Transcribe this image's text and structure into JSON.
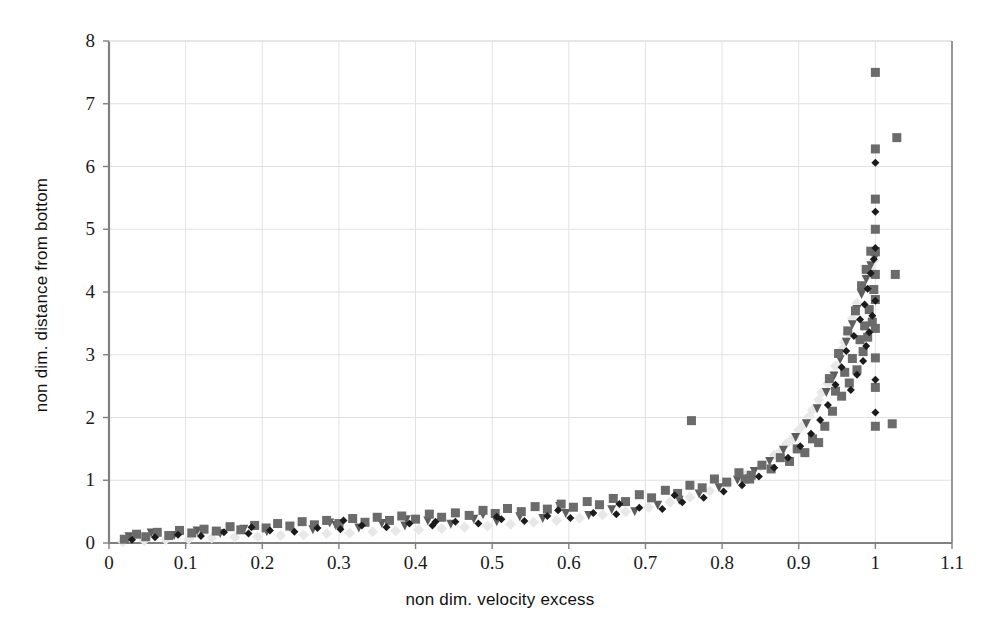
{
  "chart_data": {
    "type": "scatter",
    "title": "",
    "xlabel": "non dim. velocity excess",
    "ylabel": "non dim. distance from bottom",
    "xlim": [
      0,
      1.1
    ],
    "ylim": [
      0,
      8
    ],
    "xticks": [
      0,
      0.1,
      0.2,
      0.3,
      0.4,
      0.5,
      0.6,
      0.7,
      0.8,
      0.9,
      1,
      1.1
    ],
    "xtick_labels": [
      "0",
      "0.1",
      "0.2",
      "0.3",
      "0.4",
      "0.5",
      "0.6",
      "0.7",
      "0.8",
      "0.9",
      "1",
      "1.1"
    ],
    "yticks": [
      0,
      1,
      2,
      3,
      4,
      5,
      6,
      7,
      8
    ],
    "ytick_labels": [
      "0",
      "1",
      "2",
      "3",
      "4",
      "5",
      "6",
      "7",
      "8"
    ],
    "grid": true,
    "legend": "none",
    "background": "#ffffff",
    "gridline_color": "#e2e2e2",
    "axis_color": "#808080",
    "series": [
      {
        "name": "series-1-dark-square",
        "marker": "square",
        "color": "#6b6b6b",
        "size": 9,
        "points": [
          [
            0.02,
            0.06
          ],
          [
            0.036,
            0.14
          ],
          [
            0.048,
            0.1
          ],
          [
            0.063,
            0.17
          ],
          [
            0.078,
            0.12
          ],
          [
            0.092,
            0.2
          ],
          [
            0.108,
            0.16
          ],
          [
            0.124,
            0.22
          ],
          [
            0.14,
            0.19
          ],
          [
            0.158,
            0.26
          ],
          [
            0.172,
            0.21
          ],
          [
            0.19,
            0.28
          ],
          [
            0.205,
            0.24
          ],
          [
            0.22,
            0.31
          ],
          [
            0.236,
            0.27
          ],
          [
            0.252,
            0.34
          ],
          [
            0.268,
            0.29
          ],
          [
            0.284,
            0.36
          ],
          [
            0.3,
            0.31
          ],
          [
            0.318,
            0.39
          ],
          [
            0.334,
            0.33
          ],
          [
            0.35,
            0.41
          ],
          [
            0.366,
            0.36
          ],
          [
            0.382,
            0.43
          ],
          [
            0.4,
            0.38
          ],
          [
            0.418,
            0.46
          ],
          [
            0.434,
            0.41
          ],
          [
            0.452,
            0.48
          ],
          [
            0.47,
            0.44
          ],
          [
            0.488,
            0.52
          ],
          [
            0.504,
            0.47
          ],
          [
            0.52,
            0.55
          ],
          [
            0.538,
            0.5
          ],
          [
            0.556,
            0.58
          ],
          [
            0.572,
            0.54
          ],
          [
            0.59,
            0.62
          ],
          [
            0.606,
            0.57
          ],
          [
            0.624,
            0.66
          ],
          [
            0.64,
            0.61
          ],
          [
            0.658,
            0.71
          ],
          [
            0.674,
            0.66
          ],
          [
            0.692,
            0.77
          ],
          [
            0.708,
            0.72
          ],
          [
            0.726,
            0.84
          ],
          [
            0.742,
            0.79
          ],
          [
            0.758,
            0.92
          ],
          [
            0.76,
            1.95
          ],
          [
            0.774,
            0.88
          ],
          [
            0.79,
            1.02
          ],
          [
            0.806,
            0.97
          ],
          [
            0.822,
            1.12
          ],
          [
            0.83,
            1.02
          ],
          [
            0.838,
            1.08
          ],
          [
            0.852,
            1.24
          ],
          [
            0.864,
            1.18
          ],
          [
            0.876,
            1.36
          ],
          [
            0.888,
            1.3
          ],
          [
            0.898,
            1.5
          ],
          [
            0.908,
            1.44
          ],
          [
            0.918,
            1.66
          ],
          [
            0.926,
            1.6
          ],
          [
            0.934,
            1.86
          ],
          [
            0.94,
            2.62
          ],
          [
            0.944,
            2.1
          ],
          [
            0.948,
            2.42
          ],
          [
            0.952,
            3.02
          ],
          [
            0.956,
            2.34
          ],
          [
            0.96,
            2.72
          ],
          [
            0.964,
            3.38
          ],
          [
            0.966,
            2.55
          ],
          [
            0.97,
            2.94
          ],
          [
            0.974,
            3.7
          ],
          [
            0.976,
            2.76
          ],
          [
            0.98,
            3.24
          ],
          [
            0.982,
            4.1
          ],
          [
            0.984,
            3.05
          ],
          [
            0.986,
            3.46
          ],
          [
            0.988,
            4.36
          ],
          [
            0.99,
            3.28
          ],
          [
            0.992,
            3.72
          ],
          [
            0.994,
            4.65
          ],
          [
            0.996,
            3.52
          ],
          [
            0.998,
            4.04
          ],
          [
            1.0,
            5.0
          ],
          [
            1.0,
            5.48
          ],
          [
            1.0,
            6.28
          ],
          [
            1.0,
            7.5
          ],
          [
            1.0,
            4.28
          ],
          [
            1.0,
            4.64
          ],
          [
            1.0,
            3.88
          ],
          [
            1.0,
            3.42
          ],
          [
            1.0,
            2.95
          ],
          [
            1.0,
            2.48
          ],
          [
            1.0,
            1.86
          ],
          [
            1.028,
            6.46
          ],
          [
            1.026,
            4.28
          ],
          [
            1.022,
            1.9
          ],
          [
            0.836,
            1.02
          ]
        ]
      },
      {
        "name": "series-2-black-diamond",
        "marker": "diamond",
        "color": "#1b1b1b",
        "size": 8,
        "points": [
          [
            0.03,
            0.05
          ],
          [
            0.06,
            0.09
          ],
          [
            0.09,
            0.13
          ],
          [
            0.12,
            0.11
          ],
          [
            0.15,
            0.17
          ],
          [
            0.182,
            0.15
          ],
          [
            0.21,
            0.2
          ],
          [
            0.242,
            0.18
          ],
          [
            0.272,
            0.24
          ],
          [
            0.302,
            0.22
          ],
          [
            0.33,
            0.28
          ],
          [
            0.362,
            0.25
          ],
          [
            0.392,
            0.31
          ],
          [
            0.422,
            0.28
          ],
          [
            0.452,
            0.34
          ],
          [
            0.482,
            0.31
          ],
          [
            0.512,
            0.38
          ],
          [
            0.542,
            0.35
          ],
          [
            0.572,
            0.43
          ],
          [
            0.602,
            0.4
          ],
          [
            0.632,
            0.48
          ],
          [
            0.662,
            0.46
          ],
          [
            0.692,
            0.56
          ],
          [
            0.722,
            0.54
          ],
          [
            0.748,
            0.65
          ],
          [
            0.776,
            0.72
          ],
          [
            0.802,
            0.82
          ],
          [
            0.826,
            0.92
          ],
          [
            0.848,
            1.06
          ],
          [
            0.868,
            1.2
          ],
          [
            0.886,
            1.36
          ],
          [
            0.902,
            1.54
          ],
          [
            0.916,
            1.74
          ],
          [
            0.928,
            1.96
          ],
          [
            0.938,
            2.2
          ],
          [
            0.948,
            2.52
          ],
          [
            0.956,
            2.8
          ],
          [
            0.962,
            3.06
          ],
          [
            0.968,
            2.44
          ],
          [
            0.972,
            3.3
          ],
          [
            0.976,
            2.68
          ],
          [
            0.98,
            3.56
          ],
          [
            0.984,
            2.9
          ],
          [
            0.986,
            3.8
          ],
          [
            0.988,
            3.14
          ],
          [
            0.99,
            4.05
          ],
          [
            0.992,
            3.36
          ],
          [
            0.994,
            4.3
          ],
          [
            0.996,
            3.62
          ],
          [
            0.998,
            4.52
          ],
          [
            1.0,
            3.86
          ],
          [
            1.0,
            4.7
          ],
          [
            1.0,
            5.28
          ],
          [
            1.0,
            6.06
          ],
          [
            1.0,
            2.6
          ],
          [
            1.0,
            2.08
          ],
          [
            0.306,
            0.36
          ],
          [
            0.426,
            0.34
          ],
          [
            0.506,
            0.42
          ],
          [
            0.586,
            0.52
          ],
          [
            0.666,
            0.62
          ],
          [
            0.738,
            0.76
          ],
          [
            0.186,
            0.25
          ]
        ]
      },
      {
        "name": "series-3-medium-triangle",
        "marker": "triangle-down",
        "color": "#5d5d5d",
        "size": 9,
        "points": [
          [
            0.026,
            0.1
          ],
          [
            0.055,
            0.16
          ],
          [
            0.085,
            0.12
          ],
          [
            0.115,
            0.19
          ],
          [
            0.145,
            0.15
          ],
          [
            0.176,
            0.22
          ],
          [
            0.206,
            0.18
          ],
          [
            0.236,
            0.25
          ],
          [
            0.266,
            0.21
          ],
          [
            0.296,
            0.28
          ],
          [
            0.326,
            0.24
          ],
          [
            0.356,
            0.31
          ],
          [
            0.386,
            0.27
          ],
          [
            0.416,
            0.35
          ],
          [
            0.446,
            0.3
          ],
          [
            0.476,
            0.38
          ],
          [
            0.506,
            0.34
          ],
          [
            0.536,
            0.42
          ],
          [
            0.566,
            0.39
          ],
          [
            0.596,
            0.47
          ],
          [
            0.626,
            0.44
          ],
          [
            0.656,
            0.53
          ],
          [
            0.686,
            0.5
          ],
          [
            0.716,
            0.6
          ],
          [
            0.744,
            0.68
          ],
          [
            0.77,
            0.78
          ],
          [
            0.796,
            0.88
          ],
          [
            0.82,
            1.0
          ],
          [
            0.842,
            1.14
          ],
          [
            0.862,
            1.3
          ],
          [
            0.88,
            1.48
          ],
          [
            0.896,
            1.68
          ],
          [
            0.91,
            1.9
          ],
          [
            0.924,
            2.14
          ],
          [
            0.936,
            2.4
          ],
          [
            0.946,
            2.66
          ],
          [
            0.954,
            2.92
          ],
          [
            0.962,
            3.2
          ],
          [
            0.97,
            3.48
          ],
          [
            0.976,
            3.72
          ],
          [
            0.982,
            3.96
          ],
          [
            0.988,
            4.2
          ],
          [
            0.994,
            4.42
          ],
          [
            1.0,
            4.56
          ],
          [
            0.588,
            0.58
          ],
          [
            0.488,
            0.45
          ],
          [
            0.388,
            0.37
          ],
          [
            0.288,
            0.32
          ]
        ]
      },
      {
        "name": "series-4-light-marker",
        "marker": "diamond",
        "color": "#e8e8e8",
        "size": 11,
        "points": [
          [
            0.018,
            0.02
          ],
          [
            0.046,
            0.04
          ],
          [
            0.074,
            0.05
          ],
          [
            0.104,
            0.06
          ],
          [
            0.134,
            0.08
          ],
          [
            0.164,
            0.09
          ],
          [
            0.194,
            0.1
          ],
          [
            0.224,
            0.12
          ],
          [
            0.254,
            0.13
          ],
          [
            0.284,
            0.15
          ],
          [
            0.314,
            0.16
          ],
          [
            0.344,
            0.18
          ],
          [
            0.374,
            0.19
          ],
          [
            0.404,
            0.21
          ],
          [
            0.434,
            0.23
          ],
          [
            0.464,
            0.25
          ],
          [
            0.494,
            0.27
          ],
          [
            0.524,
            0.3
          ],
          [
            0.554,
            0.33
          ],
          [
            0.584,
            0.36
          ],
          [
            0.614,
            0.4
          ],
          [
            0.644,
            0.45
          ],
          [
            0.674,
            0.5
          ],
          [
            0.704,
            0.57
          ],
          [
            0.732,
            0.65
          ],
          [
            0.758,
            0.73
          ],
          [
            0.784,
            0.83
          ],
          [
            0.808,
            0.94
          ],
          [
            0.83,
            1.08
          ],
          [
            0.85,
            1.22
          ],
          [
            0.868,
            1.4
          ],
          [
            0.884,
            1.58
          ],
          [
            0.9,
            1.8
          ],
          [
            0.914,
            2.02
          ],
          [
            0.926,
            2.28
          ],
          [
            0.938,
            2.54
          ],
          [
            0.948,
            2.82
          ],
          [
            0.956,
            3.08
          ],
          [
            0.964,
            3.34
          ],
          [
            0.97,
            3.58
          ],
          [
            0.976,
            3.82
          ],
          [
            0.982,
            4.04
          ],
          [
            0.988,
            4.24
          ],
          [
            0.994,
            4.4
          ],
          [
            0.998,
            4.5
          ],
          [
            0.96,
            3.2
          ],
          [
            0.944,
            2.66
          ],
          [
            0.93,
            2.4
          ],
          [
            0.918,
            2.12
          ],
          [
            0.906,
            1.88
          ],
          [
            0.892,
            1.66
          ],
          [
            0.876,
            1.46
          ]
        ]
      }
    ]
  }
}
